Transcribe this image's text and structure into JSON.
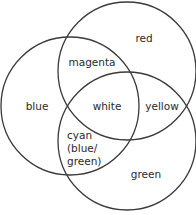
{
  "diagram": {
    "type": "venn",
    "stroke_color": "#3a3a3a",
    "circles": [
      {
        "name": "blue",
        "cx": 70,
        "cy": 106,
        "r": 69
      },
      {
        "name": "red",
        "cx": 127,
        "cy": 71,
        "r": 69
      },
      {
        "name": "green",
        "cx": 127,
        "cy": 141,
        "r": 69
      }
    ],
    "labels": {
      "red": "red",
      "magenta": "magenta",
      "blue": "blue",
      "white": "white",
      "yellow": "yellow",
      "cyan_line1": "cyan",
      "cyan_line2": "(blue/",
      "cyan_line3": "green)",
      "green": "green"
    }
  }
}
